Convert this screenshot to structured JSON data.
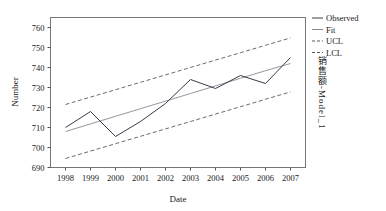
{
  "chart_data": {
    "type": "line",
    "title": "",
    "xlabel": "Date",
    "ylabel": "Number",
    "categories": [
      "1998",
      "1999",
      "2000",
      "2001",
      "2002",
      "2003",
      "2004",
      "2005",
      "2006",
      "2007"
    ],
    "x": [
      1998,
      1999,
      2000,
      2001,
      2002,
      2003,
      2004,
      2005,
      2006,
      2007
    ],
    "xlim": [
      1997.4,
      2007.6
    ],
    "ylim": [
      690,
      765
    ],
    "yticks": [
      690,
      700,
      710,
      720,
      730,
      740,
      750,
      760
    ],
    "xticks": [
      "1998",
      "1999",
      "2000",
      "2001",
      "2002",
      "2003",
      "2004",
      "2005",
      "2006",
      "2007"
    ],
    "grid": false,
    "legend_position": "right-top",
    "series": [
      {
        "name": "Observed",
        "style": "solid",
        "color": "#3a3a4a",
        "values": [
          710.0,
          718.0,
          705.5,
          713.0,
          722.0,
          734.0,
          729.5,
          736.0,
          732.0,
          745.0
        ]
      },
      {
        "name": "Fit",
        "style": "solid",
        "color": "#8a8a96",
        "values": [
          708.0,
          711.8,
          715.6,
          719.4,
          723.2,
          727.0,
          730.8,
          734.6,
          738.4,
          742.0
        ]
      },
      {
        "name": "UCL",
        "style": "dashed",
        "color": "#5a5a68",
        "values": [
          721.5,
          725.2,
          728.9,
          732.6,
          736.3,
          740.0,
          743.7,
          747.4,
          751.1,
          754.8
        ]
      },
      {
        "name": "LCL",
        "style": "dashed",
        "color": "#5a5a68",
        "values": [
          694.5,
          698.2,
          701.9,
          705.6,
          709.3,
          713.0,
          716.7,
          720.4,
          724.1,
          727.8
        ]
      }
    ]
  },
  "legend": {
    "entries": [
      {
        "label": "Observed"
      },
      {
        "label": "Fit"
      },
      {
        "label": "UCL"
      },
      {
        "label": "LCL"
      }
    ]
  },
  "model_label": {
    "cjk": "销售额",
    "separator": "-",
    "latin": "Model_1",
    "full": "销售额-Model_1"
  },
  "axes": {
    "y_title": "Number",
    "x_title": "Date"
  }
}
